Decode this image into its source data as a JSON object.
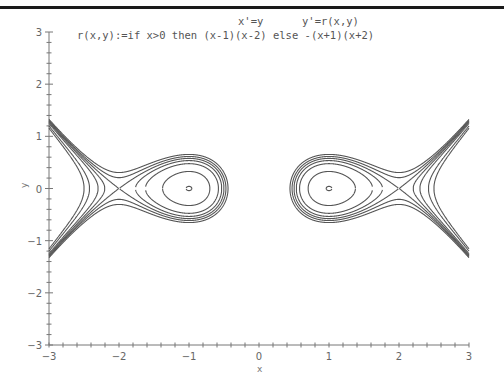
{
  "chart_data": {
    "type": "line",
    "title_line1_left": "x'=y",
    "title_line1_right": "y'=r(x,y)",
    "title_line2": "r(x,y):=if x>0 then (x-1)(x-2) else -(x+1)(x+2)",
    "xlabel": "x",
    "ylabel": "y",
    "xlim": [
      -3,
      3
    ],
    "ylim": [
      -3,
      3
    ],
    "x_ticks": [
      "-3",
      "-2",
      "-1",
      "0",
      "1",
      "2",
      "3"
    ],
    "y_ticks": [
      "-3",
      "-2",
      "-1",
      "0",
      "1",
      "2",
      "3"
    ],
    "minor_ticks_per_unit": 5,
    "grid": false,
    "equilibria": [
      {
        "x": -1,
        "y": 0,
        "type": "center"
      },
      {
        "x": 1,
        "y": 0,
        "type": "center"
      },
      {
        "x": -2,
        "y": 0,
        "type": "saddle"
      },
      {
        "x": 2,
        "y": 0,
        "type": "saddle"
      }
    ],
    "energy_levels": [
      -0.8325,
      -0.69,
      -0.6667,
      -0.645,
      -0.62,
      -0.72,
      -0.78
    ],
    "line_color": "#555555"
  },
  "window": {
    "top_bar_color": "#1a1a1a"
  }
}
